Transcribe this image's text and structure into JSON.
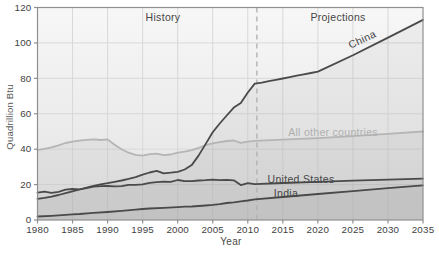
{
  "chart_data": {
    "type": "line",
    "title": "",
    "xlabel": "Year",
    "ylabel": "Quadrillion Btu",
    "xlim": [
      1980,
      2035
    ],
    "ylim": [
      0,
      120
    ],
    "x_ticks": [
      1980,
      1985,
      1990,
      1995,
      2000,
      2005,
      2010,
      2015,
      2020,
      2025,
      2030,
      2035
    ],
    "y_ticks": [
      0,
      20,
      40,
      60,
      80,
      100,
      120
    ],
    "grid": true,
    "divider_year": 2011.3,
    "region_labels": {
      "history": "History",
      "projections": "Projections"
    },
    "colors": {
      "line_dark": "#4a4a4a",
      "line_gray": "#b5b5b5",
      "grid": "#d8d8d8",
      "frame": "#8f8f8f",
      "divider": "#b3b3b3",
      "tick_text": "#3f3f3f",
      "label_gray": "#b0b0b0",
      "label_dark": "#454545",
      "plot_bg_top": "#f7f7f7",
      "plot_bg_bottom": "#e2e2e2"
    },
    "series": [
      {
        "name": "All other countries",
        "color": "#b5b5b5",
        "points": [
          [
            1980,
            39.5
          ],
          [
            1981,
            40.2
          ],
          [
            1982,
            41
          ],
          [
            1983,
            42.2
          ],
          [
            1984,
            43.5
          ],
          [
            1985,
            44.3
          ],
          [
            1986,
            44.8
          ],
          [
            1987,
            45.3
          ],
          [
            1988,
            45.5
          ],
          [
            1989,
            45.2
          ],
          [
            1990,
            45.5
          ],
          [
            1991,
            42.5
          ],
          [
            1992,
            40
          ],
          [
            1993,
            38
          ],
          [
            1994,
            36.8
          ],
          [
            1995,
            36.3
          ],
          [
            1996,
            37.2
          ],
          [
            1997,
            37.5
          ],
          [
            1998,
            36.6
          ],
          [
            1999,
            37
          ],
          [
            2000,
            38
          ],
          [
            2001,
            38.6
          ],
          [
            2002,
            39.5
          ],
          [
            2003,
            40.8
          ],
          [
            2004,
            42.3
          ],
          [
            2005,
            43.3
          ],
          [
            2006,
            44
          ],
          [
            2007,
            44.6
          ],
          [
            2008,
            44.9
          ],
          [
            2009,
            43.6
          ],
          [
            2010,
            44.3
          ],
          [
            2011,
            44.7
          ],
          [
            2015,
            45.4
          ],
          [
            2020,
            46.2
          ],
          [
            2025,
            47.3
          ],
          [
            2030,
            48.6
          ],
          [
            2035,
            50
          ]
        ]
      },
      {
        "name": "China",
        "color": "#4a4a4a",
        "points": [
          [
            1980,
            12
          ],
          [
            1981,
            12.5
          ],
          [
            1982,
            13.2
          ],
          [
            1983,
            14.1
          ],
          [
            1984,
            15.2
          ],
          [
            1985,
            16.2
          ],
          [
            1986,
            17.2
          ],
          [
            1987,
            18.3
          ],
          [
            1988,
            19.3
          ],
          [
            1989,
            20.1
          ],
          [
            1990,
            20.8
          ],
          [
            1991,
            21.6
          ],
          [
            1992,
            22.3
          ],
          [
            1993,
            23.2
          ],
          [
            1994,
            24.2
          ],
          [
            1995,
            25.6
          ],
          [
            1996,
            26.8
          ],
          [
            1997,
            27.7
          ],
          [
            1998,
            26.4
          ],
          [
            1999,
            26.7
          ],
          [
            2000,
            27.2
          ],
          [
            2001,
            28.5
          ],
          [
            2002,
            31
          ],
          [
            2003,
            36.5
          ],
          [
            2004,
            43
          ],
          [
            2005,
            49.5
          ],
          [
            2006,
            54.5
          ],
          [
            2007,
            59
          ],
          [
            2008,
            63.5
          ],
          [
            2009,
            66
          ],
          [
            2010,
            72
          ],
          [
            2011,
            77
          ],
          [
            2012,
            77.6
          ],
          [
            2013,
            78.4
          ],
          [
            2014,
            79.1
          ],
          [
            2015,
            79.9
          ],
          [
            2016,
            80.7
          ],
          [
            2017,
            81.5
          ],
          [
            2018,
            82.2
          ],
          [
            2019,
            83
          ],
          [
            2020,
            83.8
          ],
          [
            2025,
            93
          ],
          [
            2030,
            103
          ],
          [
            2035,
            113
          ]
        ]
      },
      {
        "name": "United States",
        "color": "#4a4a4a",
        "points": [
          [
            1980,
            15.4
          ],
          [
            1981,
            16
          ],
          [
            1982,
            15.3
          ],
          [
            1983,
            15.9
          ],
          [
            1984,
            17.1
          ],
          [
            1985,
            17.5
          ],
          [
            1986,
            17.3
          ],
          [
            1987,
            18
          ],
          [
            1988,
            18.8
          ],
          [
            1989,
            19.1
          ],
          [
            1990,
            19.2
          ],
          [
            1991,
            19
          ],
          [
            1992,
            19.1
          ],
          [
            1993,
            19.8
          ],
          [
            1994,
            19.9
          ],
          [
            1995,
            20.1
          ],
          [
            1996,
            21
          ],
          [
            1997,
            21.4
          ],
          [
            1998,
            21.7
          ],
          [
            1999,
            21.6
          ],
          [
            2000,
            22.6
          ],
          [
            2001,
            21.9
          ],
          [
            2002,
            21.9
          ],
          [
            2003,
            22.3
          ],
          [
            2004,
            22.5
          ],
          [
            2005,
            22.8
          ],
          [
            2006,
            22.5
          ],
          [
            2007,
            22.7
          ],
          [
            2008,
            22.4
          ],
          [
            2009,
            19.7
          ],
          [
            2010,
            20.8
          ],
          [
            2011,
            20.2
          ],
          [
            2015,
            20.9
          ],
          [
            2020,
            21.6
          ],
          [
            2025,
            22.2
          ],
          [
            2030,
            22.8
          ],
          [
            2035,
            23.4
          ]
        ]
      },
      {
        "name": "India",
        "color": "#4a4a4a",
        "points": [
          [
            1980,
            2
          ],
          [
            1982,
            2.4
          ],
          [
            1984,
            2.9
          ],
          [
            1985,
            3.2
          ],
          [
            1986,
            3.4
          ],
          [
            1988,
            4
          ],
          [
            1990,
            4.5
          ],
          [
            1992,
            5.2
          ],
          [
            1994,
            5.9
          ],
          [
            1995,
            6.2
          ],
          [
            1996,
            6.5
          ],
          [
            1998,
            6.9
          ],
          [
            2000,
            7.3
          ],
          [
            2001,
            7.5
          ],
          [
            2002,
            7.6
          ],
          [
            2003,
            7.9
          ],
          [
            2004,
            8.2
          ],
          [
            2005,
            8.5
          ],
          [
            2006,
            9
          ],
          [
            2007,
            9.6
          ],
          [
            2008,
            10
          ],
          [
            2009,
            10.5
          ],
          [
            2010,
            11
          ],
          [
            2011,
            11.7
          ],
          [
            2015,
            13
          ],
          [
            2020,
            14.7
          ],
          [
            2025,
            16.3
          ],
          [
            2030,
            18
          ],
          [
            2035,
            19.6
          ]
        ]
      }
    ]
  }
}
